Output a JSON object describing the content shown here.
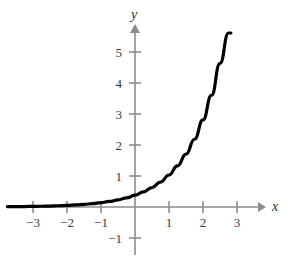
{
  "chart_data": {
    "type": "line",
    "title": "",
    "subtitle": "",
    "xlabel": "x",
    "ylabel": "y",
    "xlim": [
      -3.8,
      3.6
    ],
    "ylim": [
      -1.6,
      5.9
    ],
    "grid": false,
    "legend": null,
    "legend_position": "none",
    "annotations": [],
    "x_ticks": [
      -3,
      -2,
      -1,
      1,
      2,
      3
    ],
    "x_tick_labels": [
      "−3",
      "−2",
      "−1",
      "1",
      "2",
      "3"
    ],
    "y_ticks": [
      -1,
      1,
      2,
      3,
      4,
      5
    ],
    "y_tick_labels": [
      "−1",
      "1",
      "2",
      "3",
      "4",
      "5"
    ],
    "axis_arrows": [
      "x-positive",
      "y-positive"
    ],
    "series": [
      {
        "name": "exponential-curve",
        "color": "#000000",
        "line_width": 3.2,
        "x": [
          -3.75,
          -3.5,
          -3.25,
          -3.0,
          -2.75,
          -2.5,
          -2.25,
          -2.0,
          -1.75,
          -1.5,
          -1.25,
          -1.0,
          -0.75,
          -0.5,
          -0.25,
          0.0,
          0.25,
          0.5,
          0.75,
          1.0,
          1.25,
          1.5,
          1.75,
          2.0,
          2.25,
          2.5,
          2.75,
          2.82
        ],
        "y": [
          0.009,
          0.011,
          0.015,
          0.019,
          0.024,
          0.031,
          0.04,
          0.051,
          0.066,
          0.085,
          0.109,
          0.14,
          0.18,
          0.231,
          0.296,
          0.38,
          0.488,
          0.626,
          0.804,
          1.033,
          1.326,
          1.703,
          2.186,
          2.808,
          3.605,
          4.63,
          5.944,
          6.3
        ]
      }
    ],
    "curve_equation_note": "y ≈ 0.38·e^x",
    "colors": {
      "background": "#ffffff",
      "axis": "#8c8c8c",
      "curve": "#000000",
      "tick_text": "#3a3a3a",
      "axis_label_text": "#2c2c2c"
    }
  },
  "layout": {
    "origin_px": {
      "x": 135,
      "y": 207
    },
    "unit_px": {
      "x": 34,
      "y": 31
    }
  }
}
